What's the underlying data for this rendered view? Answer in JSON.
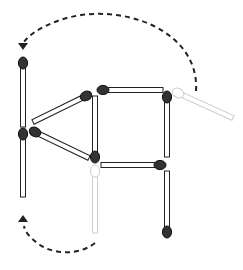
{
  "colors": {
    "stick_fill": "#ffffff",
    "stick_stroke": "#222222",
    "head_fill": "#333333",
    "ghost_stroke": "#cfcfcf",
    "ghost_head_fill": "#ffffff",
    "arrow": "#222222"
  },
  "matches": [
    {
      "id": "left-upper-vertical",
      "state": "present"
    },
    {
      "id": "left-lower-vertical",
      "state": "present"
    },
    {
      "id": "diagonal-upper",
      "state": "present"
    },
    {
      "id": "diagonal-lower",
      "state": "present"
    },
    {
      "id": "middle-vertical",
      "state": "present"
    },
    {
      "id": "top-horizontal",
      "state": "present"
    },
    {
      "id": "right-upper-vertical",
      "state": "present"
    },
    {
      "id": "middle-horizontal",
      "state": "present"
    },
    {
      "id": "right-lower-vertical",
      "state": "present"
    },
    {
      "id": "ghost-right-diagonal",
      "state": "removed"
    },
    {
      "id": "ghost-lower-middle-vertical",
      "state": "removed"
    }
  ],
  "moves": [
    {
      "from": "ghost-right-diagonal",
      "to": "left-upper-vertical",
      "arrow": "dashed-arc-top"
    },
    {
      "from": "ghost-lower-middle-vertical",
      "to": "left-lower-vertical",
      "arrow": "dashed-arc-bottom"
    }
  ]
}
